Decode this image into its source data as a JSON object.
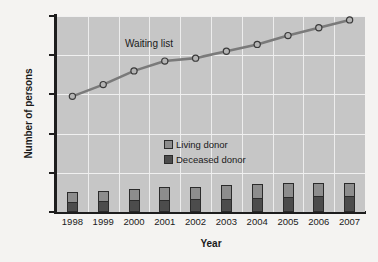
{
  "chart_data": {
    "type": "bar",
    "title": "",
    "xlabel": "Year",
    "ylabel": "Number of persons",
    "categories": [
      "1998",
      "1999",
      "2000",
      "2001",
      "2002",
      "2003",
      "2004",
      "2005",
      "2006",
      "2007"
    ],
    "ylim": [
      0,
      100000
    ],
    "yticks": [
      0,
      20000,
      40000,
      60000,
      80000,
      100000
    ],
    "ytick_labels": [
      "0",
      "20,000",
      "40,000",
      "60,000",
      "80,000",
      "100,000"
    ],
    "grid": true,
    "legend_position": "center-right-inside",
    "annotations": [
      {
        "text": "Waiting list",
        "x": "2000",
        "y": 87000
      }
    ],
    "series": [
      {
        "name": "Deceased donor",
        "type": "bar",
        "stack": "donors",
        "color": "#4c4c4c",
        "values": [
          5300,
          5700,
          5900,
          6100,
          6400,
          6600,
          7200,
          7700,
          8100,
          8100
        ]
      },
      {
        "name": "Living donor",
        "type": "bar",
        "stack": "donors",
        "color": "#8d8d8d",
        "values": [
          4800,
          5000,
          5900,
          6500,
          6500,
          7000,
          7100,
          7100,
          6800,
          6600
        ]
      },
      {
        "name": "Waiting list",
        "type": "line",
        "color": "#7a7a7a",
        "marker": "circle",
        "values": [
          59000,
          65000,
          72000,
          77000,
          78500,
          82000,
          85500,
          90000,
          94000,
          98000
        ]
      }
    ]
  },
  "legend": {
    "items": [
      {
        "label": "Living donor",
        "color": "#8d8d8d"
      },
      {
        "label": "Deceased donor",
        "color": "#4c4c4c"
      }
    ]
  }
}
